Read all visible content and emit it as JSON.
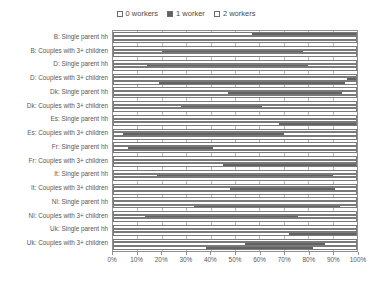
{
  "legend": {
    "position": "top-center",
    "entries": [
      {
        "label": "0 workers",
        "color": "#ffffff",
        "swatch": "sw-0"
      },
      {
        "label": "1 worker",
        "color": "#636363",
        "swatch": "sw-1"
      },
      {
        "label": "2 workers",
        "color": "#ffffff",
        "swatch": "sw-2"
      }
    ]
  },
  "axes": {
    "xlabel": "",
    "ylabel": "",
    "xticks": [
      "0%",
      "10%",
      "20%",
      "30%",
      "40%",
      "50%",
      "60%",
      "70%",
      "80%",
      "90%",
      "100%"
    ],
    "xlim": [
      0,
      100
    ],
    "grid": true
  },
  "chart_data": {
    "type": "bar",
    "orientation": "horizontal",
    "stacked": true,
    "title": "",
    "xlabel": "",
    "ylabel": "",
    "xlim": [
      0,
      100
    ],
    "xticks": [
      "0%",
      "10%",
      "20%",
      "30%",
      "40%",
      "50%",
      "60%",
      "70%",
      "80%",
      "90%",
      "100%"
    ],
    "grid": true,
    "legend_position": "top-center",
    "categories": [
      "B: Single parent hh",
      "B: Couples with 3+ children",
      "D: Single parent hh",
      "D: Couples with 3+ children",
      "Dk: Single parent hh",
      "Dk: Couples with 3+ children",
      "Es: Single parent hh",
      "Es: Couples with 3+ children",
      "Fr: Single parent hh",
      "Fr: Couples with 3+ children",
      "It: Single parent hh",
      "It: Couples with 3+ children",
      "Nl: Single parent hh",
      "Nl: Couples with 3+ children",
      "Uk: Single parent hh",
      "Uk: Couples with 3+ children"
    ],
    "series": [
      {
        "name": "0 workers",
        "color": "#ffffff"
      },
      {
        "name": "1 worker",
        "color": "#636363"
      },
      {
        "name": "2 workers",
        "color": "#ffffff"
      }
    ],
    "groups": [
      {
        "category": "B: Single parent hh",
        "bars": [
          {
            "values": [
              57,
              43,
              0
            ]
          },
          {
            "values": [
              100,
              0,
              0
            ]
          },
          {
            "values": [
              100,
              0,
              0
            ]
          }
        ]
      },
      {
        "category": "B: Couples with 3+ children",
        "bars": [
          {
            "values": [
              100,
              0,
              0
            ]
          },
          {
            "values": [
              20,
              58,
              22
            ]
          },
          {
            "values": [
              100,
              0,
              0
            ]
          }
        ]
      },
      {
        "category": "D: Single parent hh",
        "bars": [
          {
            "values": [
              100,
              0,
              0
            ]
          },
          {
            "values": [
              14,
              66,
              20
            ]
          },
          {
            "values": [
              100,
              0,
              0
            ]
          }
        ]
      },
      {
        "category": "D: Couples with 3+ children",
        "bars": [
          {
            "values": [
              100,
              0,
              0
            ]
          },
          {
            "values": [
              96,
              4,
              0
            ]
          },
          {
            "values": [
              19,
              76,
              5
            ]
          }
        ]
      },
      {
        "category": "Dk: Single parent hh",
        "bars": [
          {
            "values": [
              100,
              0,
              0
            ]
          },
          {
            "values": [
              47,
              47,
              6
            ]
          },
          {
            "values": [
              100,
              0,
              0
            ]
          }
        ]
      },
      {
        "category": "Dk: Couples with 3+ children",
        "bars": [
          {
            "values": [
              100,
              0,
              0
            ]
          },
          {
            "values": [
              28,
              33,
              39
            ]
          },
          {
            "values": [
              100,
              0,
              0
            ]
          }
        ]
      },
      {
        "category": "Es: Single parent hh",
        "bars": [
          {
            "values": [
              100,
              0,
              0
            ]
          },
          {
            "values": [
              100,
              0,
              0
            ]
          },
          {
            "values": [
              68,
              32,
              0
            ]
          }
        ]
      },
      {
        "category": "Es: Couples with 3+ children",
        "bars": [
          {
            "values": [
              100,
              0,
              0
            ]
          },
          {
            "values": [
              4,
              66,
              30
            ]
          },
          {
            "values": [
              100,
              0,
              0
            ]
          }
        ]
      },
      {
        "category": "Fr: Single parent hh",
        "bars": [
          {
            "values": [
              100,
              0,
              0
            ]
          },
          {
            "values": [
              6,
              35,
              59
            ]
          },
          {
            "values": [
              100,
              0,
              0
            ]
          }
        ]
      },
      {
        "category": "Fr: Couples with 3+ children",
        "bars": [
          {
            "values": [
              100,
              0,
              0
            ]
          },
          {
            "values": [
              100,
              0,
              0
            ]
          },
          {
            "values": [
              45,
              55,
              0
            ]
          }
        ]
      },
      {
        "category": "It: Single parent hh",
        "bars": [
          {
            "values": [
              100,
              0,
              0
            ]
          },
          {
            "values": [
              18,
              72,
              10
            ]
          },
          {
            "values": [
              100,
              0,
              0
            ]
          }
        ]
      },
      {
        "category": "It: Couples with 3+ children",
        "bars": [
          {
            "values": [
              100,
              0,
              0
            ]
          },
          {
            "values": [
              48,
              43,
              9
            ]
          },
          {
            "values": [
              100,
              0,
              0
            ]
          }
        ]
      },
      {
        "category": "Nl: Single parent hh",
        "bars": [
          {
            "values": [
              100,
              0,
              0
            ]
          },
          {
            "values": [
              100,
              0,
              0
            ]
          },
          {
            "values": [
              33,
              60,
              7
            ]
          }
        ]
      },
      {
        "category": "Nl: Couples with 3+ children",
        "bars": [
          {
            "values": [
              100,
              0,
              0
            ]
          },
          {
            "values": [
              13,
              63,
              24
            ]
          },
          {
            "values": [
              100,
              0,
              0
            ]
          }
        ]
      },
      {
        "category": "Uk: Single parent hh",
        "bars": [
          {
            "values": [
              100,
              0,
              0
            ]
          },
          {
            "values": [
              100,
              0,
              0
            ]
          },
          {
            "values": [
              72,
              28,
              0
            ]
          }
        ]
      },
      {
        "category": "Uk: Couples with 3+ children",
        "bars": [
          {
            "values": [
              100,
              0,
              0
            ]
          },
          {
            "values": [
              54,
              33,
              13
            ]
          },
          {
            "values": [
              38,
              44,
              18
            ]
          }
        ]
      }
    ]
  }
}
